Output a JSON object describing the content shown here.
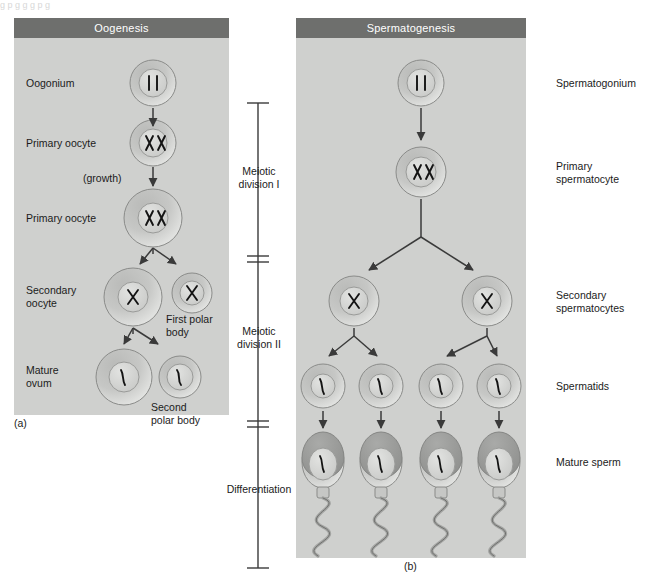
{
  "figure": {
    "top_running_text": "g            p           g  g  g                                                                 p        g",
    "panel_a_label": "(a)",
    "panel_b_label": "(b)"
  },
  "panels": {
    "oogenesis": {
      "title": "Oogenesis",
      "labels": [
        {
          "id": "oogonium",
          "text": "Oogonium"
        },
        {
          "id": "primary-oocyte-1",
          "text": "Primary oocyte"
        },
        {
          "id": "growth",
          "text": "(growth)"
        },
        {
          "id": "primary-oocyte-2",
          "text": "Primary oocyte"
        },
        {
          "id": "secondary-oocyte",
          "text": "Secondary\noocyte"
        },
        {
          "id": "first-polar-body",
          "text": "First polar\nbody"
        },
        {
          "id": "mature-ovum",
          "text": "Mature\novum"
        },
        {
          "id": "second-polar-body",
          "text": "Second\npolar body"
        }
      ]
    },
    "spermatogenesis": {
      "title": "Spermatogenesis",
      "labels": [
        {
          "id": "spermatogonium",
          "text": "Spermatogonium"
        },
        {
          "id": "primary-spermatocyte",
          "text": "Primary\nspermatocyte"
        },
        {
          "id": "secondary-spermatocytes",
          "text": "Secondary\nspermatocytes"
        },
        {
          "id": "spermatids",
          "text": "Spermatids"
        },
        {
          "id": "mature-sperm",
          "text": "Mature sperm"
        }
      ]
    }
  },
  "stage_bracket": {
    "items": [
      {
        "id": "meiotic-division-1",
        "text": "Meiotic\ndivision I"
      },
      {
        "id": "meiotic-division-2",
        "text": "Meiotic\ndivision II"
      },
      {
        "id": "differentiation",
        "text": "Differentiation"
      }
    ]
  },
  "colors": {
    "panel_background": "#cfd0ce",
    "header_background": "#6e6f6d",
    "header_text": "#ffffff",
    "label_text": "#1b1b1b",
    "cell_fill": "#c3c4c2",
    "nucleus_fill": "#d6d7d5",
    "chromosome": "#1b1b1b",
    "arrow": "#3a3a3a",
    "sperm_head_cap": "#9c9d9b"
  }
}
